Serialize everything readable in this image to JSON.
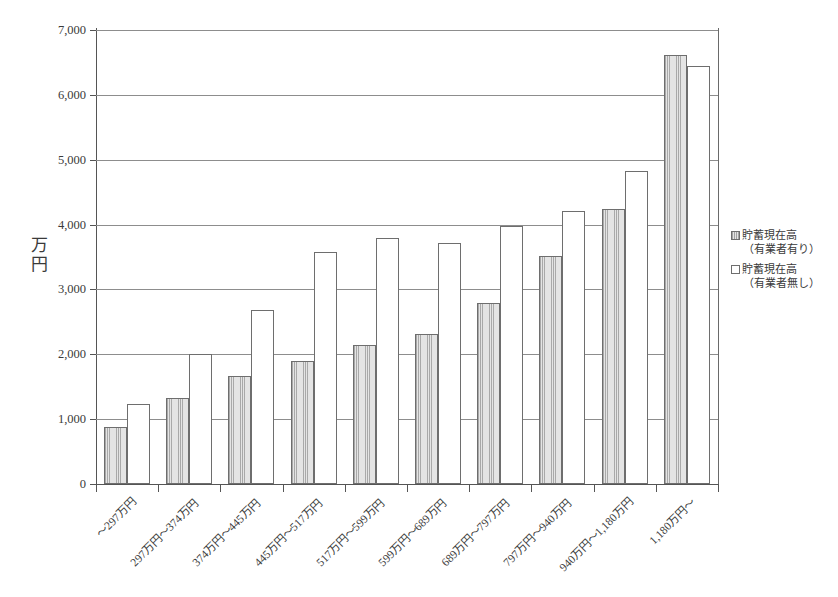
{
  "chart_data": {
    "type": "bar",
    "title": "",
    "xlabel": "",
    "ylabel": "万円",
    "ylim": [
      0,
      7000
    ],
    "ytick_values": [
      0,
      1000,
      2000,
      3000,
      4000,
      5000,
      6000,
      7000
    ],
    "ytick_labels": [
      "0",
      "1,000",
      "2,000",
      "3,000",
      "4,000",
      "5,000",
      "6,000",
      "7,000"
    ],
    "grid": true,
    "legend_position": "right",
    "categories": [
      "～297万円",
      "297万円～374万円",
      "374万円～445万円",
      "445万円～517万円",
      "517万円～599万円",
      "599万円～689万円",
      "689万円～797万円",
      "797万円～940万円",
      "940万円～1,180万円",
      "1,180万円～"
    ],
    "series": [
      {
        "name": "貯蓄現在高（有業者有り）",
        "name_line1": "貯蓄現在高",
        "name_line2": "（有業者有り）",
        "fill": "hatched-gray",
        "color": "#e4e4e4",
        "values": [
          880,
          1320,
          1660,
          1900,
          2150,
          2310,
          2790,
          3520,
          4240,
          6620
        ]
      },
      {
        "name": "貯蓄現在高（有業者無し）",
        "name_line1": "貯蓄現在高",
        "name_line2": "（有業者無し）",
        "fill": "white",
        "color": "#ffffff",
        "values": [
          1240,
          2010,
          2680,
          3580,
          3800,
          3720,
          3980,
          4210,
          4820,
          6450
        ]
      }
    ]
  },
  "axis": {
    "y_title_text": "万\n円"
  },
  "legend": {
    "entries": [
      {
        "line1": "貯蓄現在高",
        "line2": "（有業者有り）",
        "swatch": "gray"
      },
      {
        "line1": "貯蓄現在高",
        "line2": "（有業者無し）",
        "swatch": "white"
      }
    ]
  }
}
